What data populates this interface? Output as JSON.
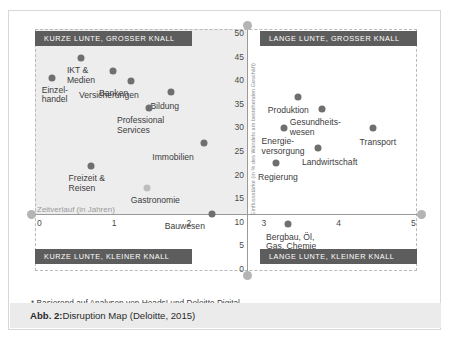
{
  "caption": {
    "prefix": "Abb. 2:",
    "text": " Disruption Map (Deloitte, 2015)"
  },
  "footnote": "* Basierend auf Analysen von Heads! und Deloitte Digital",
  "quadrants": {
    "top_left": "KURZE LUNTE, GROSSER KNALL",
    "top_right": "LANGE LUNTE, GROSSER KNALL",
    "bottom_left": "KURZE LUNTE, KLEINER KNALL",
    "bottom_right": "LANGE LUNTE, KLEINER KNALL"
  },
  "colors": {
    "banner": "#5d5d5d",
    "point": "#6f6f6f",
    "point_light": "#bdbdbd",
    "shade": "#ededed",
    "axis": "#9a9a9a",
    "caption_bar": "#ebebeb"
  },
  "chart_data": {
    "type": "scatter",
    "title": "Disruption Map (Deloitte, 2015)",
    "xlabel": "Zeitverlauf (in Jahren)",
    "ylabel": "Einflussstärke (in % des Wandels am bestehenden Geschäft)",
    "xlim": [
      0,
      5
    ],
    "ylim": [
      0,
      50
    ],
    "xticks": [
      "0",
      "1",
      "2",
      "3",
      "4",
      "5"
    ],
    "yticks": [
      "50",
      "45",
      "40",
      "35",
      "30",
      "25",
      "20",
      "15",
      "10",
      "5",
      "0"
    ],
    "grid": false,
    "legend": "none",
    "quadrant_split": {
      "x": 2.75,
      "y": 15
    },
    "points": [
      {
        "label": "Einzel-\nhandel",
        "x": 0.17,
        "y": 40.5,
        "tone": "dark",
        "lx": -10,
        "ly": 8
      },
      {
        "label": "IKT &\nMedien",
        "x": 0.56,
        "y": 44.6,
        "tone": "dark",
        "lx": -14,
        "ly": 8
      },
      {
        "label": "Banken",
        "x": 0.99,
        "y": 41.9,
        "tone": "dark",
        "lx": -14,
        "ly": 18
      },
      {
        "label": "Versicherungen",
        "x": 1.23,
        "y": 39.8,
        "tone": "dark",
        "lx": -52,
        "ly": 10
      },
      {
        "label": "Bildung",
        "x": 1.77,
        "y": 37.6,
        "tone": "dark",
        "lx": -21,
        "ly": 10
      },
      {
        "label": "Professional\nServices",
        "x": 1.47,
        "y": 34.1,
        "tone": "dark",
        "lx": -32,
        "ly": 8
      },
      {
        "label": "Immobilien",
        "x": 2.21,
        "y": 26.6,
        "tone": "dark",
        "lx": -52,
        "ly": 10
      },
      {
        "label": "Freizeit &\nReisen",
        "x": 0.69,
        "y": 21.8,
        "tone": "dark",
        "lx": -22,
        "ly": 8
      },
      {
        "label": "Gastronomie",
        "x": 1.44,
        "y": 17.1,
        "tone": "light",
        "lx": -16,
        "ly": 8
      },
      {
        "label": "Bauwesen",
        "x": 2.31,
        "y": 11.6,
        "tone": "dark",
        "lx": -47,
        "ly": 8
      },
      {
        "label": "Produktion",
        "x": 3.46,
        "y": 36.4,
        "tone": "dark",
        "lx": -30,
        "ly": 9
      },
      {
        "label": "Gesundheits-\nwesen",
        "x": 3.78,
        "y": 33.8,
        "tone": "dark",
        "lx": -32,
        "ly": 9
      },
      {
        "label": "Transport",
        "x": 4.46,
        "y": 29.8,
        "tone": "dark",
        "lx": -13,
        "ly": 10
      },
      {
        "label": "Energie-\nversorgung",
        "x": 3.27,
        "y": 29.8,
        "tone": "dark",
        "lx": -22,
        "ly": 9
      },
      {
        "label": "Landwirtschaft",
        "x": 3.73,
        "y": 25.7,
        "tone": "dark",
        "lx": -16,
        "ly": 10
      },
      {
        "label": "Regierung",
        "x": 3.17,
        "y": 22.4,
        "tone": "dark",
        "lx": -18,
        "ly": 10
      },
      {
        "label": "Bergbau, Öl,\nGas, Chemie",
        "x": 3.33,
        "y": 9.6,
        "tone": "dark",
        "lx": -22,
        "ly": 9
      }
    ]
  }
}
